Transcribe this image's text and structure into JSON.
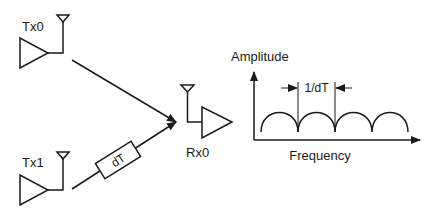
{
  "diagram": {
    "transmitters": [
      {
        "label": "Tx0"
      },
      {
        "label": "Tx1"
      }
    ],
    "delay": {
      "label": "dT"
    },
    "receiver": {
      "label": "Rx0"
    },
    "spectrum": {
      "y_axis_label": "Amplitude",
      "x_axis_label": "Frequency",
      "spacing_label": "1/dT",
      "lobes": 4
    },
    "colors": {
      "stroke": "#1a1a1a",
      "background": "#ffffff"
    }
  }
}
